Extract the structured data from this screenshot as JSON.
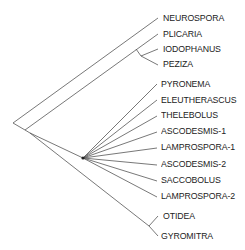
{
  "diagram": {
    "type": "phylogenetic-tree",
    "line_color": "#555555",
    "taxa": [
      {
        "id": "neurospora",
        "label": "NEUROSPORA",
        "x": 163,
        "y": 18
      },
      {
        "id": "plicaria",
        "label": "PLICARIA",
        "x": 163,
        "y": 34
      },
      {
        "id": "iodophanus",
        "label": "IODOPHANUS",
        "x": 163,
        "y": 49
      },
      {
        "id": "peziza",
        "label": "PEZIZA",
        "x": 163,
        "y": 64
      },
      {
        "id": "pyronema",
        "label": "PYRONEMA",
        "x": 161,
        "y": 84
      },
      {
        "id": "eleutherascus",
        "label": "ELEUTHERASCUS",
        "x": 161,
        "y": 100
      },
      {
        "id": "thelebolus",
        "label": "THELEBOLUS",
        "x": 161,
        "y": 115
      },
      {
        "id": "ascodesmis-1",
        "label": "ASCODESMIS-1",
        "x": 161,
        "y": 131
      },
      {
        "id": "lamprospora-1",
        "label": "LAMPROSPORA-1",
        "x": 161,
        "y": 147
      },
      {
        "id": "ascodesmis-2",
        "label": "ASCODESMIS-2",
        "x": 161,
        "y": 164
      },
      {
        "id": "saccobolus",
        "label": "SACCOBOLUS",
        "x": 161,
        "y": 180
      },
      {
        "id": "lamprospora-2",
        "label": "LAMPROSPORA-2",
        "x": 161,
        "y": 196
      },
      {
        "id": "otidea",
        "label": "OTIDEA",
        "x": 163,
        "y": 216
      },
      {
        "id": "gyromitra",
        "label": "GYROMITRA",
        "x": 161,
        "y": 236
      }
    ]
  }
}
